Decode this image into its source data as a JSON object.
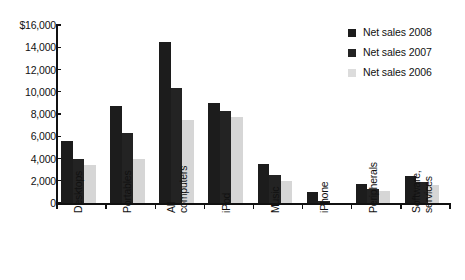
{
  "chart_data": {
    "type": "bar",
    "title": "",
    "xlabel": "",
    "ylabel": "",
    "grid": false,
    "legend_position": "top-right",
    "ylim": [
      0,
      16000
    ],
    "ytick_values": [
      16000,
      14000,
      12000,
      10000,
      8000,
      6000,
      4000,
      2000,
      0
    ],
    "ytick_labels": [
      "$16,000",
      "14,000",
      "12,000",
      "10,000",
      "8,000",
      "6,000",
      "4,000",
      "2,000",
      "0"
    ],
    "categories": [
      "Desktops",
      "Portables",
      "All computers",
      "iPod",
      "Music",
      "iPhone",
      "Peripherals",
      "Software, services"
    ],
    "category_lines": [
      [
        "Desktops"
      ],
      [
        "Portables"
      ],
      [
        "All",
        "computers"
      ],
      [
        "iPod"
      ],
      [
        "Music"
      ],
      [
        "iPhone"
      ],
      [
        "Peripherals"
      ],
      [
        "Software,",
        "services"
      ]
    ],
    "series": [
      {
        "name": "Net sales 2008",
        "color": "#1c1c1c",
        "values": [
          5600,
          8700,
          14500,
          9000,
          3500,
          1000,
          1700,
          2400
        ]
      },
      {
        "name": "Net sales 2007",
        "color": "#232323",
        "values": [
          4000,
          6300,
          10300,
          8300,
          2500,
          150,
          1300,
          1900
        ]
      },
      {
        "name": "Net sales 2006",
        "color": "#d6d6d6",
        "values": [
          3400,
          4000,
          7500,
          7700,
          2000,
          0,
          1100,
          1600
        ]
      }
    ]
  },
  "legend": {
    "items": [
      {
        "label": "Net sales 2008",
        "swatch": "s2008"
      },
      {
        "label": "Net sales 2007",
        "swatch": "s2007"
      },
      {
        "label": "Net sales 2006",
        "swatch": "s2006"
      }
    ]
  },
  "colors": {
    "series_2008": "#1c1c1c",
    "series_2007": "#232323",
    "series_2006": "#d6d6d6",
    "axis": "#111111",
    "background": "#ffffff"
  }
}
